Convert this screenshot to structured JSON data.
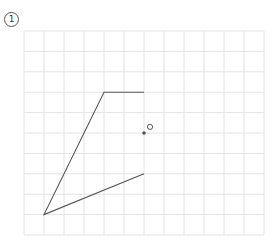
{
  "problem": {
    "number_label": "1"
  },
  "grid": {
    "origin_x": 24,
    "origin_y": 31,
    "cols": 12,
    "rows": 10,
    "cell_w": 20,
    "cell_h": 20.4,
    "line_color": "#e4e4e4"
  },
  "figure": {
    "stroke_color": "#555555",
    "polyline_points": [
      [
        6,
        3
      ],
      [
        4,
        3
      ],
      [
        1,
        9
      ],
      [
        6,
        7
      ]
    ],
    "filled_dot": [
      6,
      5
    ],
    "hollow_circle": [
      6.3,
      4.7
    ]
  }
}
